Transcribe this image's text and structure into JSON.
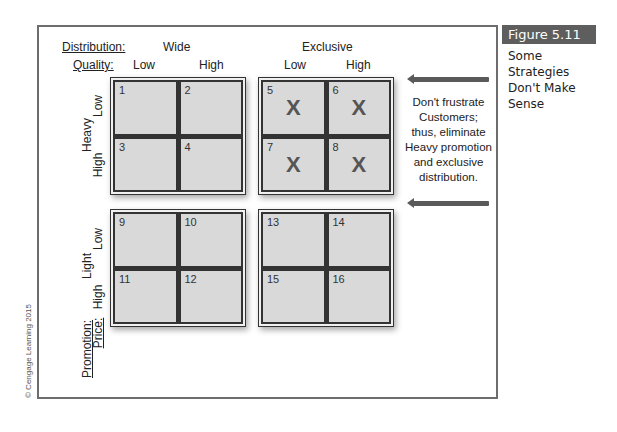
{
  "figure": {
    "label": "Figure 5.11",
    "caption": "Some Strategies Don't Make Sense",
    "caption_lines": [
      "Some",
      "Strategies",
      "Don't Make",
      "Sense"
    ]
  },
  "headers": {
    "distribution_label": "Distribution:",
    "quality_label": "Quality:",
    "distribution": [
      "Wide",
      "Exclusive"
    ],
    "quality": [
      "Low",
      "High",
      "Low",
      "High"
    ]
  },
  "axis": {
    "promotion_label": "Promotion:",
    "price_label": "Price:",
    "promotion": [
      "Heavy",
      "Light"
    ],
    "price": [
      "Low",
      "High",
      "Low",
      "High"
    ]
  },
  "grids": [
    {
      "name": "heavy-wide",
      "cells": [
        {
          "num": "1",
          "mark": ""
        },
        {
          "num": "2",
          "mark": ""
        },
        {
          "num": "3",
          "mark": ""
        },
        {
          "num": "4",
          "mark": ""
        }
      ]
    },
    {
      "name": "heavy-exclusive",
      "cells": [
        {
          "num": "5",
          "mark": "X"
        },
        {
          "num": "6",
          "mark": "X"
        },
        {
          "num": "7",
          "mark": "X"
        },
        {
          "num": "8",
          "mark": "X"
        }
      ]
    },
    {
      "name": "light-wide",
      "cells": [
        {
          "num": "9",
          "mark": ""
        },
        {
          "num": "10",
          "mark": ""
        },
        {
          "num": "11",
          "mark": ""
        },
        {
          "num": "12",
          "mark": ""
        }
      ]
    },
    {
      "name": "light-exclusive",
      "cells": [
        {
          "num": "13",
          "mark": ""
        },
        {
          "num": "14",
          "mark": ""
        },
        {
          "num": "15",
          "mark": ""
        },
        {
          "num": "16",
          "mark": ""
        }
      ]
    }
  ],
  "note": {
    "lines": [
      "Don't frustrate",
      "Customers;",
      "thus, eliminate",
      "Heavy promotion",
      "and exclusive",
      "distribution."
    ]
  },
  "copyright": "© Cengage Learning 2015",
  "colors": {
    "frame": "#6d6d6d",
    "cell_fill": "#d9d9d9",
    "figure_label_bg": "#5e5e5e",
    "arrow": "#5a5a5a"
  }
}
